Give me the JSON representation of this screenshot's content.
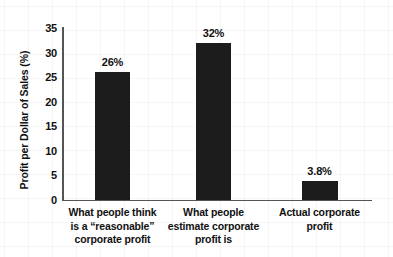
{
  "chart_data": {
    "type": "bar",
    "title": "",
    "subtitle": "",
    "xlabel": "",
    "ylabel": "Profit per Dollar of Sales (%)",
    "categories": [
      "What people think is a “reasonable” corporate profit",
      "What people estimate corporate profit is",
      "Actual corporate profit"
    ],
    "category_lines": [
      [
        "What people think",
        "is a “reasonable”",
        "corporate profit"
      ],
      [
        "What people",
        "estimate corporate",
        "profit is"
      ],
      [
        "Actual corporate",
        "profit"
      ]
    ],
    "values": [
      26,
      32,
      3.8
    ],
    "value_labels": [
      "26%",
      "32%",
      "3.8%"
    ],
    "ylim": [
      0,
      35
    ],
    "yticks": [
      0,
      5,
      10,
      15,
      20,
      25,
      30,
      35
    ],
    "ytick_labels": [
      "0",
      "5",
      "10",
      "15",
      "20",
      "25",
      "30",
      "35"
    ],
    "grid": false,
    "legend": "none",
    "bar_color": "#1c1c1c",
    "text_color": "#111111",
    "axis_color": "#555555",
    "background_color": "#ffffff"
  }
}
